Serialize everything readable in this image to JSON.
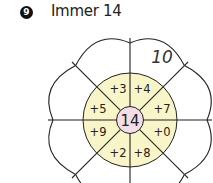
{
  "exercise": {
    "number": "9",
    "title": "Immer 14"
  },
  "flower": {
    "center_value": "14",
    "segments": [
      {
        "position": "top-left",
        "label": "+3"
      },
      {
        "position": "top-right",
        "label": "+4"
      },
      {
        "position": "right-upper",
        "label": "+7"
      },
      {
        "position": "right-lower",
        "label": "+0"
      },
      {
        "position": "bottom-right",
        "label": "+8"
      },
      {
        "position": "bottom-left",
        "label": "+2"
      },
      {
        "position": "left-lower",
        "label": "+9"
      },
      {
        "position": "left-upper",
        "label": "+5"
      }
    ],
    "petal_answers": {
      "top-right": "10"
    }
  },
  "colors": {
    "ring_fill": "#f8f5c8",
    "center_fill": "#f3dde6",
    "line": "#222222",
    "badge": "#111111"
  }
}
